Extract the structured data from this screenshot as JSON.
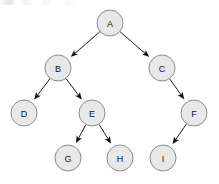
{
  "diagram": {
    "type": "directed-tree",
    "width": 219,
    "height": 184,
    "background_color": "#ffffff",
    "node_fill_color": "#e8e8e8",
    "node_stroke_color": "#8c8c8c",
    "node_radius": 13,
    "label_color": "#111111",
    "edge_color": "#1a1a1a",
    "arrowhead_color": "#111111"
  },
  "nodes": [
    {
      "id": "A",
      "label": "A",
      "cx": 110,
      "cy": 23,
      "level": 0
    },
    {
      "id": "B",
      "label": "B",
      "cx": 58,
      "cy": 68,
      "level": 1
    },
    {
      "id": "C",
      "label": "C",
      "cx": 162,
      "cy": 68,
      "level": 1
    },
    {
      "id": "D",
      "label": "D",
      "cx": 24,
      "cy": 113,
      "level": 2
    },
    {
      "id": "E",
      "label": "E",
      "cx": 92,
      "cy": 113,
      "level": 2
    },
    {
      "id": "F",
      "label": "F",
      "cx": 194,
      "cy": 113,
      "level": 2
    },
    {
      "id": "G",
      "label": "G",
      "cx": 68,
      "cy": 158,
      "level": 3
    },
    {
      "id": "H",
      "label": "H",
      "cx": 120,
      "cy": 158,
      "level": 3
    },
    {
      "id": "I",
      "label": "I",
      "cx": 163,
      "cy": 158,
      "level": 3
    }
  ],
  "edges": [
    {
      "from": "A",
      "to": "B",
      "side": "left"
    },
    {
      "from": "A",
      "to": "C",
      "side": "right"
    },
    {
      "from": "B",
      "to": "D",
      "side": "left"
    },
    {
      "from": "B",
      "to": "E",
      "side": "right"
    },
    {
      "from": "C",
      "to": "F",
      "side": "right"
    },
    {
      "from": "E",
      "to": "G",
      "side": "left"
    },
    {
      "from": "E",
      "to": "H",
      "side": "right"
    },
    {
      "from": "F",
      "to": "I",
      "side": "left"
    }
  ]
}
